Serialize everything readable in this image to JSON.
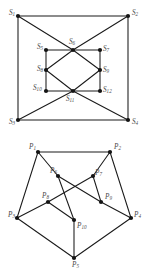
{
  "figure": {
    "background_color": "#ffffff",
    "edge_color": "#1a1a1a",
    "vertex_color": "#141414",
    "label_color": "#4a4a4a"
  },
  "chart_data": {
    "type": "diagram",
    "title": "",
    "graphs": [
      {
        "name": "square-graph",
        "label_prefix": "S",
        "vertex_count": 12,
        "vertices": [
          {
            "id": "S1",
            "label": "S",
            "sub": "1",
            "x": 18,
            "y": 16,
            "label_x": 9,
            "label_y": 13
          },
          {
            "id": "S2",
            "label": "S",
            "sub": "2",
            "x": 128,
            "y": 16,
            "label_x": 132,
            "label_y": 13
          },
          {
            "id": "S3",
            "label": "S",
            "sub": "3",
            "x": 18,
            "y": 120,
            "label_x": 9,
            "label_y": 122
          },
          {
            "id": "S4",
            "label": "S",
            "sub": "4",
            "x": 128,
            "y": 120,
            "label_x": 132,
            "label_y": 122
          },
          {
            "id": "S5",
            "label": "S",
            "sub": "5",
            "x": 46,
            "y": 50,
            "label_x": 37,
            "label_y": 47
          },
          {
            "id": "S6",
            "label": "S",
            "sub": "6",
            "x": 73,
            "y": 50,
            "label_x": 69,
            "label_y": 42
          },
          {
            "id": "S7",
            "label": "S",
            "sub": "7",
            "x": 100,
            "y": 50,
            "label_x": 103,
            "label_y": 49
          },
          {
            "id": "S8",
            "label": "S",
            "sub": "8",
            "x": 46,
            "y": 70,
            "label_x": 37,
            "label_y": 69
          },
          {
            "id": "S9",
            "label": "S",
            "sub": "9",
            "x": 100,
            "y": 70,
            "label_x": 103,
            "label_y": 70
          },
          {
            "id": "S10",
            "label": "S",
            "sub": "10",
            "x": 46,
            "y": 91,
            "label_x": 33,
            "label_y": 88
          },
          {
            "id": "S11",
            "label": "S",
            "sub": "11",
            "x": 73,
            "y": 91,
            "label_x": 66,
            "label_y": 99
          },
          {
            "id": "S12",
            "label": "S",
            "sub": "12",
            "x": 100,
            "y": 91,
            "label_x": 103,
            "label_y": 90
          }
        ],
        "edges": [
          [
            "S1",
            "S2"
          ],
          [
            "S1",
            "S3"
          ],
          [
            "S2",
            "S4"
          ],
          [
            "S3",
            "S4"
          ],
          [
            "S1",
            "S6"
          ],
          [
            "S2",
            "S6"
          ],
          [
            "S3",
            "S11"
          ],
          [
            "S4",
            "S11"
          ],
          [
            "S5",
            "S7"
          ],
          [
            "S5",
            "S10"
          ],
          [
            "S7",
            "S12"
          ],
          [
            "S10",
            "S12"
          ],
          [
            "S6",
            "S8"
          ],
          [
            "S6",
            "S9"
          ],
          [
            "S8",
            "S11"
          ],
          [
            "S9",
            "S11"
          ]
        ]
      },
      {
        "name": "pentagon-graph",
        "label_prefix": "P",
        "vertex_count": 10,
        "vertices": [
          {
            "id": "P1",
            "label": "P",
            "sub": "1",
            "x": 38,
            "y": 17,
            "label_x": 29,
            "label_y": 12
          },
          {
            "id": "P2",
            "label": "P",
            "sub": "2",
            "x": 110,
            "y": 17,
            "label_x": 114,
            "label_y": 12
          },
          {
            "id": "P3",
            "label": "P",
            "sub": "3",
            "x": 17,
            "y": 83,
            "label_x": 8,
            "label_y": 80
          },
          {
            "id": "P4",
            "label": "P",
            "sub": "4",
            "x": 131,
            "y": 83,
            "label_x": 134,
            "label_y": 80
          },
          {
            "id": "P5",
            "label": "P",
            "sub": "5",
            "x": 74,
            "y": 123,
            "label_x": 72,
            "label_y": 130
          },
          {
            "id": "P6",
            "label": "P",
            "sub": "6",
            "x": 58,
            "y": 41,
            "label_x": 50,
            "label_y": 36
          },
          {
            "id": "P7",
            "label": "P",
            "sub": "7",
            "x": 93,
            "y": 41,
            "label_x": 95,
            "label_y": 38
          },
          {
            "id": "P8",
            "label": "P",
            "sub": "8",
            "x": 48,
            "y": 67,
            "label_x": 42,
            "label_y": 61
          },
          {
            "id": "P9",
            "label": "P",
            "sub": "9",
            "x": 101,
            "y": 67,
            "label_x": 105,
            "label_y": 62
          },
          {
            "id": "P10",
            "label": "P",
            "sub": "10",
            "x": 74,
            "y": 85,
            "label_x": 77,
            "label_y": 91
          }
        ],
        "edges": [
          [
            "P1",
            "P2"
          ],
          [
            "P1",
            "P3"
          ],
          [
            "P2",
            "P4"
          ],
          [
            "P3",
            "P5"
          ],
          [
            "P4",
            "P5"
          ],
          [
            "P1",
            "P6"
          ],
          [
            "P2",
            "P7"
          ],
          [
            "P3",
            "P8"
          ],
          [
            "P4",
            "P9"
          ],
          [
            "P5",
            "P10"
          ],
          [
            "P6",
            "P9"
          ],
          [
            "P9",
            "P7"
          ],
          [
            "P7",
            "P8"
          ],
          [
            "P8",
            "P10"
          ],
          [
            "P10",
            "P6"
          ]
        ]
      }
    ]
  }
}
